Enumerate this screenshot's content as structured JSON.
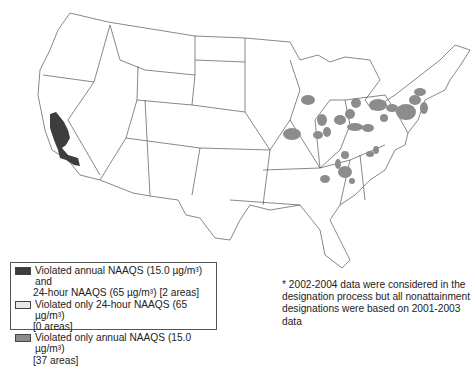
{
  "map": {
    "title": "",
    "region": "Contiguous United States",
    "colors": {
      "both_violated": "#3d3d3d",
      "only_24_hour": "#e8e8e8",
      "only_annual": "#8c8c8c",
      "state_fill": "#ffffff",
      "state_border": "#555555"
    }
  },
  "legend": {
    "items": [
      {
        "line1": "Violated annual NAAQS (15.0 µg/m³) and",
        "line2": "24-hour NAAQS (65 µg/m³) [2 areas]",
        "swatch": "both_violated"
      },
      {
        "line1": "Violated only 24-hour NAAQS (65 µg/m³)",
        "line2": "[0 areas]",
        "swatch": "only_24_hour"
      },
      {
        "line1": "Violated only annual NAAQS (15.0 µg/m³)",
        "line2": "[37 areas]",
        "swatch": "only_annual"
      }
    ]
  },
  "note": {
    "text": "* 2002-2004 data were considered in the designation process but all nonattainment designations were based on 2001-2003 data"
  }
}
